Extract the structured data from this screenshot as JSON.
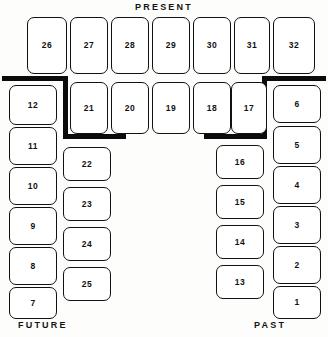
{
  "diagram": {
    "headings": {
      "present": "PRESENT",
      "future": "FUTURE",
      "past": "PAST"
    },
    "colors": {
      "ink": "#111111",
      "wall": "#0b0b0b",
      "paper": "#fdfdfb",
      "box_fill": "#ffffff"
    },
    "seats": [
      {
        "label": "26",
        "x": 27,
        "y": 17,
        "w": 40,
        "h": 57
      },
      {
        "label": "27",
        "x": 70,
        "y": 17,
        "w": 38,
        "h": 57
      },
      {
        "label": "28",
        "x": 111,
        "y": 17,
        "w": 38,
        "h": 57
      },
      {
        "label": "29",
        "x": 152,
        "y": 17,
        "w": 38,
        "h": 57
      },
      {
        "label": "30",
        "x": 193,
        "y": 17,
        "w": 38,
        "h": 57
      },
      {
        "label": "31",
        "x": 234,
        "y": 17,
        "w": 36,
        "h": 57
      },
      {
        "label": "32",
        "x": 273,
        "y": 17,
        "w": 42,
        "h": 57
      },
      {
        "label": "12",
        "x": 9,
        "y": 85,
        "w": 48,
        "h": 40
      },
      {
        "label": "21",
        "x": 70,
        "y": 82,
        "w": 38,
        "h": 52
      },
      {
        "label": "20",
        "x": 111,
        "y": 82,
        "w": 38,
        "h": 52
      },
      {
        "label": "19",
        "x": 152,
        "y": 82,
        "w": 38,
        "h": 52
      },
      {
        "label": "18",
        "x": 193,
        "y": 82,
        "w": 38,
        "h": 52
      },
      {
        "label": "17",
        "x": 231,
        "y": 82,
        "w": 36,
        "h": 52
      },
      {
        "label": "6",
        "x": 273,
        "y": 85,
        "w": 48,
        "h": 38
      },
      {
        "label": "11",
        "x": 9,
        "y": 127,
        "w": 48,
        "h": 38
      },
      {
        "label": "10",
        "x": 9,
        "y": 167,
        "w": 48,
        "h": 38
      },
      {
        "label": "9",
        "x": 9,
        "y": 207,
        "w": 48,
        "h": 38
      },
      {
        "label": "8",
        "x": 9,
        "y": 247,
        "w": 48,
        "h": 38
      },
      {
        "label": "7",
        "x": 9,
        "y": 287,
        "w": 48,
        "h": 32
      },
      {
        "label": "5",
        "x": 273,
        "y": 126,
        "w": 48,
        "h": 38
      },
      {
        "label": "4",
        "x": 273,
        "y": 166,
        "w": 48,
        "h": 38
      },
      {
        "label": "3",
        "x": 273,
        "y": 206,
        "w": 48,
        "h": 38
      },
      {
        "label": "2",
        "x": 273,
        "y": 246,
        "w": 48,
        "h": 38
      },
      {
        "label": "1",
        "x": 273,
        "y": 286,
        "w": 48,
        "h": 33
      },
      {
        "label": "22",
        "x": 63,
        "y": 147,
        "w": 48,
        "h": 34
      },
      {
        "label": "23",
        "x": 63,
        "y": 187,
        "w": 48,
        "h": 34
      },
      {
        "label": "24",
        "x": 63,
        "y": 227,
        "w": 48,
        "h": 34
      },
      {
        "label": "25",
        "x": 63,
        "y": 267,
        "w": 48,
        "h": 34
      },
      {
        "label": "16",
        "x": 216,
        "y": 145,
        "w": 48,
        "h": 34
      },
      {
        "label": "15",
        "x": 216,
        "y": 185,
        "w": 48,
        "h": 34
      },
      {
        "label": "14",
        "x": 216,
        "y": 225,
        "w": 48,
        "h": 34
      },
      {
        "label": "13",
        "x": 216,
        "y": 265,
        "w": 48,
        "h": 34
      }
    ],
    "walls": [
      {
        "name": "wall-left-top",
        "x": 2,
        "y": 76,
        "w": 66,
        "h": 5
      },
      {
        "name": "wall-left-vertical",
        "x": 63,
        "y": 76,
        "w": 5,
        "h": 63
      },
      {
        "name": "wall-left-bottom",
        "x": 63,
        "y": 134,
        "w": 63,
        "h": 5
      },
      {
        "name": "wall-right-top",
        "x": 262,
        "y": 76,
        "w": 64,
        "h": 5
      },
      {
        "name": "wall-right-vertical",
        "x": 262,
        "y": 76,
        "w": 5,
        "h": 63
      },
      {
        "name": "wall-right-bottom",
        "x": 204,
        "y": 134,
        "w": 63,
        "h": 5
      }
    ]
  }
}
